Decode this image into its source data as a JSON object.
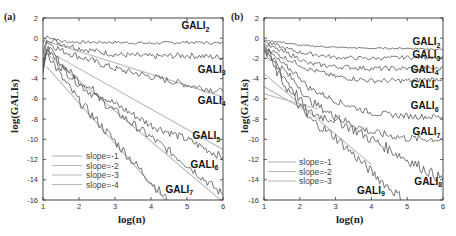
{
  "panels": [
    {
      "label": "(a)",
      "ylabel": "log(GALIs)",
      "xlabel": "log(n)"
    },
    {
      "label": "(b)",
      "ylabel": "log(GALIs)",
      "xlabel": "log(n)"
    }
  ],
  "chart_data": [
    {
      "type": "line",
      "title": "(a)",
      "xlabel": "log(n)",
      "ylabel": "log(GALIs)",
      "xlim": [
        1,
        6
      ],
      "ylim": [
        -16,
        2
      ],
      "xticks": [
        1,
        2,
        3,
        4,
        5,
        6
      ],
      "yticks": [
        2,
        0,
        -2,
        -4,
        -6,
        -8,
        -10,
        -12,
        -14,
        -16
      ],
      "grid": false,
      "legend_position": "lower left",
      "legend": [
        "slope=-1",
        "slope=-2",
        "slope=-3",
        "slope=-4"
      ],
      "series": [
        {
          "name": "GALI2",
          "label": "GALI",
          "sub": "2",
          "label_at": [
            4.85,
            0.9
          ],
          "noise": 0.15,
          "x": [
            1,
            1.1,
            1.5,
            2,
            3,
            4,
            5,
            6
          ],
          "y": [
            -0.5,
            0.2,
            -0.3,
            -0.4,
            -0.4,
            -0.5,
            -0.4,
            -0.5
          ]
        },
        {
          "name": "GALI3",
          "label": "GALI",
          "sub": "3",
          "label_at": [
            5.3,
            -3.4
          ],
          "noise": 0.3,
          "x": [
            1,
            1.1,
            1.5,
            2,
            3,
            4,
            5,
            6
          ],
          "y": [
            -1.5,
            0.0,
            -0.5,
            -1.0,
            -1.6,
            -1.8,
            -1.7,
            -1.9
          ]
        },
        {
          "name": "GALI4",
          "label": "GALI",
          "sub": "4",
          "label_at": [
            5.3,
            -6.5
          ],
          "noise": 0.35,
          "x": [
            1,
            1.1,
            1.5,
            2,
            3,
            4,
            5,
            6
          ],
          "y": [
            -2.5,
            -0.3,
            -1.2,
            -1.8,
            -3.0,
            -3.8,
            -4.6,
            -5.3
          ]
        },
        {
          "name": "GALI5",
          "label": "GALI",
          "sub": "5",
          "label_at": [
            5.15,
            -10.0
          ],
          "noise": 0.4,
          "x": [
            1,
            1.1,
            1.5,
            2,
            3,
            4,
            5,
            6
          ],
          "y": [
            -3.0,
            -0.8,
            -2.5,
            -4.2,
            -6.5,
            -8.6,
            -10.0,
            -11.8
          ]
        },
        {
          "name": "GALI6",
          "label": "GALI",
          "sub": "6",
          "label_at": [
            5.1,
            -12.8
          ],
          "noise": 0.45,
          "x": [
            1,
            1.1,
            1.5,
            2,
            3,
            4,
            5,
            6
          ],
          "y": [
            -3.2,
            -1.0,
            -2.8,
            -4.5,
            -7.2,
            -9.8,
            -12.5,
            -15.5
          ]
        },
        {
          "name": "GALI7",
          "label": "GALI",
          "sub": "7",
          "label_at": [
            4.4,
            -15.3
          ],
          "noise": 0.5,
          "x": [
            1,
            1.1,
            1.5,
            2,
            2.5,
            3,
            3.5,
            4,
            4.5
          ],
          "y": [
            -3.5,
            -1.2,
            -3.8,
            -6.2,
            -8.2,
            -10.2,
            -12.2,
            -14.2,
            -16.2
          ]
        }
      ],
      "reference_lines": [
        {
          "name": "slope=-1",
          "x": [
            1.1,
            6
          ],
          "y": [
            -0.3,
            -5.8
          ]
        },
        {
          "name": "slope=-2",
          "x": [
            1.1,
            6
          ],
          "y": [
            -1.2,
            -11.0
          ]
        },
        {
          "name": "slope=-3",
          "x": [
            1.1,
            6
          ],
          "y": [
            -1.5,
            -16.2
          ]
        },
        {
          "name": "slope=-4",
          "x": [
            1.1,
            4.4
          ],
          "y": [
            -2.8,
            -16.0
          ]
        }
      ]
    },
    {
      "type": "line",
      "title": "(b)",
      "xlabel": "log(n)",
      "ylabel": "log(GALIs)",
      "xlim": [
        1,
        6
      ],
      "ylim": [
        -16,
        2
      ],
      "xticks": [
        1,
        2,
        3,
        4,
        5,
        6
      ],
      "yticks": [
        2,
        0,
        -2,
        -4,
        -6,
        -8,
        -10,
        -12,
        -14,
        -16
      ],
      "grid": false,
      "legend_position": "lower left",
      "legend": [
        "slope=-1",
        "slope=-2",
        "slope=-3"
      ],
      "series": [
        {
          "name": "GALI2",
          "label": "GALI",
          "sub": "2",
          "label_at": [
            5.15,
            -0.7
          ],
          "noise": 0.08,
          "x": [
            1,
            1.5,
            2,
            3,
            4,
            5,
            6
          ],
          "y": [
            -0.2,
            -0.4,
            -0.7,
            -0.9,
            -1.0,
            -1.0,
            -1.1
          ]
        },
        {
          "name": "GALI3",
          "label": "GALI",
          "sub": "3",
          "label_at": [
            5.15,
            -2.0
          ],
          "noise": 0.2,
          "x": [
            1,
            1.5,
            2,
            3,
            4,
            5,
            6
          ],
          "y": [
            -0.3,
            -0.9,
            -1.4,
            -1.9,
            -2.0,
            -1.9,
            -1.9
          ]
        },
        {
          "name": "GALI4",
          "label": "GALI",
          "sub": "4",
          "label_at": [
            5.1,
            -3.4
          ],
          "noise": 0.25,
          "x": [
            1,
            1.5,
            2,
            2.2,
            3,
            4,
            5,
            6
          ],
          "y": [
            -0.6,
            -1.3,
            -2.0,
            -2.5,
            -2.8,
            -3.0,
            -3.0,
            -3.0
          ]
        },
        {
          "name": "GALI5",
          "label": "GALI",
          "sub": "5",
          "label_at": [
            5.1,
            -4.9
          ],
          "noise": 0.25,
          "x": [
            1,
            1.5,
            2,
            2.2,
            3,
            4,
            5,
            6
          ],
          "y": [
            -0.8,
            -1.8,
            -2.6,
            -3.0,
            -3.8,
            -4.2,
            -4.2,
            -4.0
          ]
        },
        {
          "name": "GALI6",
          "label": "GALI",
          "sub": "6",
          "label_at": [
            5.1,
            -7.0
          ],
          "noise": 0.3,
          "x": [
            1,
            1.5,
            2,
            2.2,
            3,
            4,
            5,
            6
          ],
          "y": [
            -0.9,
            -2.5,
            -3.8,
            -4.8,
            -6.2,
            -7.4,
            -7.7,
            -7.8
          ]
        },
        {
          "name": "GALI7",
          "label": "GALI",
          "sub": "7",
          "label_at": [
            5.15,
            -9.6
          ],
          "noise": 0.4,
          "x": [
            1,
            1.5,
            2,
            2.2,
            3,
            4,
            5,
            6
          ],
          "y": [
            -1.0,
            -3.0,
            -4.8,
            -6.0,
            -7.8,
            -9.3,
            -9.9,
            -10.0
          ]
        },
        {
          "name": "GALI8",
          "label": "GALI",
          "sub": "8",
          "label_at": [
            5.2,
            -14.5
          ],
          "noise": 0.55,
          "x": [
            1,
            1.5,
            2,
            2.2,
            3,
            4,
            5,
            6
          ],
          "y": [
            -1.1,
            -3.5,
            -6.0,
            -7.4,
            -8.0,
            -10.0,
            -12.0,
            -14.0
          ]
        },
        {
          "name": "GALI9",
          "label": "GALI",
          "sub": "9",
          "label_at": [
            3.6,
            -15.4
          ],
          "noise": 0.5,
          "x": [
            1,
            1.5,
            2,
            2.2,
            3,
            3.5,
            4,
            4.5,
            5
          ],
          "y": [
            -1.2,
            -4.2,
            -6.8,
            -7.8,
            -9.8,
            -11.5,
            -13.2,
            -14.8,
            -16.2
          ]
        }
      ],
      "reference_lines": [
        {
          "name": "slope=-1",
          "x": [
            1,
            2.5
          ],
          "y": [
            -5.5,
            -7.0
          ]
        },
        {
          "name": "slope=-2",
          "x": [
            1,
            2.2
          ],
          "y": [
            -4.8,
            -7.2
          ]
        },
        {
          "name": "slope=-3",
          "x": [
            1,
            4.0
          ],
          "y": [
            -3.5,
            -12.5
          ]
        }
      ]
    }
  ],
  "colors": {
    "axis": "#333333",
    "curve": "#555555",
    "reference": "#bbbbbb",
    "text": "#222222"
  }
}
